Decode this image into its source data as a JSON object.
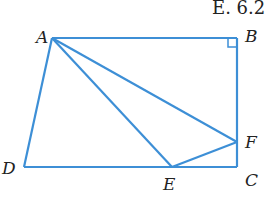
{
  "header_text": "E. 6.2",
  "figure": {
    "stroke_color": "#3d8fd6",
    "points": {
      "A": {
        "label": "A",
        "x": 52,
        "y": 38
      },
      "B": {
        "label": "B",
        "x": 237,
        "y": 38
      },
      "C": {
        "label": "C",
        "x": 237,
        "y": 167
      },
      "D": {
        "label": "D",
        "x": 24,
        "y": 167
      },
      "E": {
        "label": "E",
        "x": 172,
        "y": 167
      },
      "F": {
        "label": "F",
        "x": 237,
        "y": 142
      }
    },
    "segments": [
      "AB",
      "BC",
      "CD",
      "DA",
      "AF",
      "AE",
      "EF"
    ],
    "right_angle_at": "B"
  }
}
